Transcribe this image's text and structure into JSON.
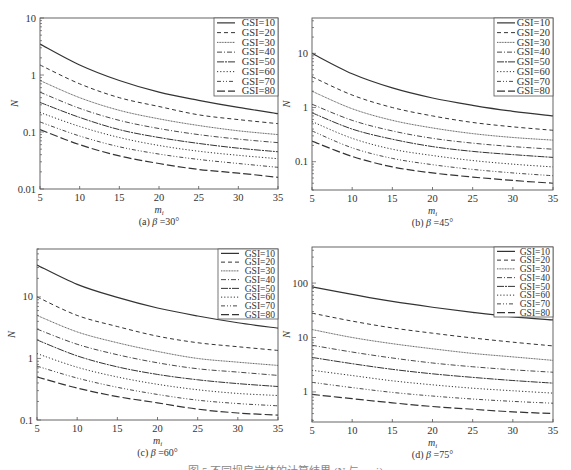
{
  "figure": {
    "bottom_caption": "图 5   不同坝肩岩体的计算结果 (N 与 m_i)"
  },
  "chart_data": [
    {
      "type": "line",
      "id": "a",
      "title": "(a) β=30°",
      "caption_prefix": "(a)",
      "beta_label": "β",
      "beta_value": "=30°",
      "xlabel": "m_i",
      "ylabel": "N",
      "yscale": "log",
      "xlim": [
        5,
        35
      ],
      "ylim": [
        0.01,
        10
      ],
      "xticks": [
        5,
        10,
        15,
        20,
        25,
        30,
        35
      ],
      "yticks": [
        0.01,
        0.1,
        1,
        10
      ],
      "ytick_labels": [
        "0.01",
        "0.1",
        "1",
        "10"
      ],
      "legend_position": "upper right",
      "frame": {
        "x": 40,
        "y": 18,
        "w": 238,
        "h": 171
      },
      "legend_box": {
        "x": 214,
        "y": 18,
        "w": 64,
        "h": 78
      },
      "x": [
        5,
        10,
        15,
        20,
        25,
        30,
        35
      ],
      "series": [
        {
          "name": "GSI=10",
          "values": [
            3.5,
            1.5,
            0.8,
            0.5,
            0.36,
            0.27,
            0.21
          ]
        },
        {
          "name": "GSI=20",
          "values": [
            1.5,
            0.7,
            0.4,
            0.28,
            0.2,
            0.165,
            0.14
          ]
        },
        {
          "name": "GSI=30",
          "values": [
            0.8,
            0.4,
            0.24,
            0.17,
            0.13,
            0.105,
            0.09
          ]
        },
        {
          "name": "GSI=40",
          "values": [
            0.5,
            0.26,
            0.16,
            0.115,
            0.09,
            0.075,
            0.065
          ]
        },
        {
          "name": "GSI=50",
          "values": [
            0.33,
            0.18,
            0.11,
            0.08,
            0.063,
            0.052,
            0.045
          ]
        },
        {
          "name": "GSI=60",
          "values": [
            0.22,
            0.125,
            0.08,
            0.058,
            0.046,
            0.039,
            0.034
          ]
        },
        {
          "name": "GSI=70",
          "values": [
            0.15,
            0.085,
            0.055,
            0.041,
            0.033,
            0.028,
            0.024
          ]
        },
        {
          "name": "GSI=80",
          "values": [
            0.11,
            0.06,
            0.038,
            0.028,
            0.022,
            0.019,
            0.016
          ]
        }
      ]
    },
    {
      "type": "line",
      "id": "b",
      "title": "(b) β=45°",
      "caption_prefix": "(b)",
      "beta_label": "β",
      "beta_value": "=45°",
      "xlabel": "m_i",
      "ylabel": "N",
      "yscale": "log",
      "xlim": [
        5,
        35
      ],
      "ylim": [
        0.03,
        45
      ],
      "xticks": [
        5,
        10,
        15,
        20,
        25,
        30,
        35
      ],
      "yticks": [
        0.1,
        1,
        10
      ],
      "ytick_labels": [
        "0.1",
        "1",
        "10"
      ],
      "legend_position": "upper right",
      "frame": {
        "x": 312,
        "y": 18,
        "w": 241,
        "h": 172
      },
      "legend_box": {
        "x": 494,
        "y": 18,
        "w": 59,
        "h": 78
      },
      "x": [
        5,
        10,
        15,
        20,
        25,
        30,
        35
      ],
      "series": [
        {
          "name": "GSI=10",
          "values": [
            10,
            4.2,
            2.3,
            1.5,
            1.1,
            0.85,
            0.7
          ]
        },
        {
          "name": "GSI=20",
          "values": [
            3.7,
            1.7,
            1.0,
            0.7,
            0.53,
            0.44,
            0.38
          ]
        },
        {
          "name": "GSI=30",
          "values": [
            2.0,
            0.95,
            0.58,
            0.42,
            0.33,
            0.28,
            0.25
          ]
        },
        {
          "name": "GSI=40",
          "values": [
            1.15,
            0.58,
            0.37,
            0.27,
            0.22,
            0.19,
            0.17
          ]
        },
        {
          "name": "GSI=50",
          "values": [
            0.8,
            0.4,
            0.26,
            0.19,
            0.155,
            0.135,
            0.12
          ]
        },
        {
          "name": "GSI=60",
          "values": [
            0.55,
            0.27,
            0.17,
            0.13,
            0.105,
            0.09,
            0.08
          ]
        },
        {
          "name": "GSI=70",
          "values": [
            0.37,
            0.18,
            0.115,
            0.088,
            0.072,
            0.062,
            0.055
          ]
        },
        {
          "name": "GSI=80",
          "values": [
            0.24,
            0.125,
            0.08,
            0.062,
            0.052,
            0.045,
            0.04
          ]
        }
      ]
    },
    {
      "type": "line",
      "id": "c",
      "title": "(c) β=60°",
      "caption_prefix": "(c)",
      "beta_label": "β",
      "beta_value": "=60°",
      "xlabel": "m_i",
      "ylabel": "N",
      "yscale": "log",
      "xlim": [
        5,
        35
      ],
      "ylim": [
        0.1,
        60
      ],
      "xticks": [
        5,
        10,
        15,
        20,
        25,
        30,
        35
      ],
      "yticks": [
        0.1,
        1,
        10
      ],
      "ytick_labels": [
        "0.1",
        "1",
        "10"
      ],
      "legend_position": "upper right",
      "frame": {
        "x": 37,
        "y": 249,
        "w": 241,
        "h": 171
      },
      "legend_box": {
        "x": 218,
        "y": 249,
        "w": 60,
        "h": 70
      },
      "x": [
        5,
        10,
        15,
        20,
        25,
        30,
        35
      ],
      "series": [
        {
          "name": "GSI=10",
          "values": [
            33,
            16,
            9.8,
            6.6,
            4.9,
            3.8,
            3.1
          ]
        },
        {
          "name": "GSI=20",
          "values": [
            10,
            5.0,
            3.3,
            2.3,
            1.8,
            1.55,
            1.35
          ]
        },
        {
          "name": "GSI=30",
          "values": [
            5.0,
            2.7,
            1.8,
            1.3,
            1.0,
            0.87,
            0.77
          ]
        },
        {
          "name": "GSI=40",
          "values": [
            3.0,
            1.7,
            1.15,
            0.85,
            0.68,
            0.6,
            0.53
          ]
        },
        {
          "name": "GSI=50",
          "values": [
            2.0,
            1.1,
            0.73,
            0.55,
            0.45,
            0.39,
            0.35
          ]
        },
        {
          "name": "GSI=60",
          "values": [
            1.2,
            0.72,
            0.5,
            0.38,
            0.31,
            0.27,
            0.25
          ]
        },
        {
          "name": "GSI=70",
          "values": [
            0.75,
            0.48,
            0.34,
            0.26,
            0.21,
            0.185,
            0.17
          ]
        },
        {
          "name": "GSI=80",
          "values": [
            0.5,
            0.33,
            0.24,
            0.19,
            0.15,
            0.13,
            0.12
          ]
        }
      ]
    },
    {
      "type": "line",
      "id": "d",
      "title": "(d) β=75°",
      "caption_prefix": "(d)",
      "beta_label": "β",
      "beta_value": "=75°",
      "xlabel": "m_i",
      "ylabel": "N",
      "yscale": "log",
      "xlim": [
        5,
        35
      ],
      "ylim": [
        0.28,
        460
      ],
      "xticks": [
        5,
        10,
        15,
        20,
        25,
        30,
        35
      ],
      "yticks": [
        1,
        10,
        100
      ],
      "ytick_labels": [
        "1",
        "10",
        "100"
      ],
      "legend_position": "upper right",
      "frame": {
        "x": 312,
        "y": 247,
        "w": 241,
        "h": 175
      },
      "legend_box": {
        "x": 494,
        "y": 247,
        "w": 59,
        "h": 70
      },
      "x": [
        5,
        10,
        15,
        20,
        25,
        30,
        35
      ],
      "series": [
        {
          "name": "GSI=10",
          "values": [
            85,
            62,
            46,
            36,
            29,
            24,
            21
          ]
        },
        {
          "name": "GSI=20",
          "values": [
            28,
            20,
            15,
            12,
            9.8,
            8.2,
            7.0
          ]
        },
        {
          "name": "GSI=30",
          "values": [
            14,
            10,
            7.7,
            6.2,
            5.1,
            4.4,
            3.8
          ]
        },
        {
          "name": "GSI=40",
          "values": [
            7.2,
            5.4,
            4.2,
            3.4,
            2.9,
            2.55,
            2.3
          ]
        },
        {
          "name": "GSI=50",
          "values": [
            4.3,
            3.3,
            2.6,
            2.15,
            1.85,
            1.62,
            1.45
          ]
        },
        {
          "name": "GSI=60",
          "values": [
            2.5,
            2.0,
            1.6,
            1.35,
            1.17,
            1.05,
            0.95
          ]
        },
        {
          "name": "GSI=70",
          "values": [
            1.5,
            1.2,
            0.98,
            0.84,
            0.74,
            0.67,
            0.62
          ]
        },
        {
          "name": "GSI=80",
          "values": [
            0.9,
            0.75,
            0.63,
            0.54,
            0.48,
            0.43,
            0.4
          ]
        }
      ]
    }
  ],
  "styles": {
    "line_color": "#333333",
    "frame_color": "#555555",
    "dashes": {
      "GSI=10": "",
      "GSI=20": "4,3",
      "GSI=30": "1,0.6",
      "GSI=40": "5,2,1,2",
      "GSI=50": "7,1,2,1",
      "GSI=60": "1.2,2",
      "GSI=70": "4,2,1,2,1,2",
      "GSI=80": "8,3"
    },
    "widths": {
      "GSI=10": 1.2,
      "GSI=20": 1.0,
      "GSI=30": 0.8,
      "GSI=40": 0.9,
      "GSI=50": 1.0,
      "GSI=60": 1.0,
      "GSI=70": 0.9,
      "GSI=80": 1.2
    }
  }
}
